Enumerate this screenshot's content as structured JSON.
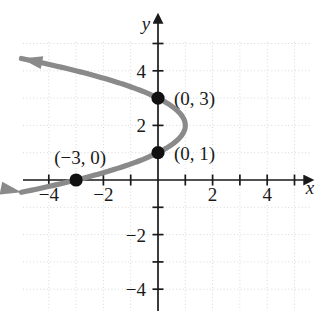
{
  "figure": {
    "background_color": "#ffffff",
    "grid_color": "#d8d8d8",
    "axis_color": "#1a1a1a",
    "curve_color": "#8a8a8a",
    "point_color": "#111111",
    "axis_names": {
      "x": "x",
      "y": "y"
    }
  },
  "chart_data": {
    "type": "line",
    "title": "",
    "xlabel": "x",
    "ylabel": "y",
    "xlim": [
      -5,
      5.5
    ],
    "ylim": [
      -5,
      5
    ],
    "grid": true,
    "grid_step": 1,
    "legend": "none",
    "x_ticks": [
      -4,
      -2,
      2,
      4
    ],
    "x_tick_labels": [
      "−4",
      "−2",
      "2",
      "4"
    ],
    "y_ticks": [
      4,
      2,
      -2,
      -4
    ],
    "y_tick_labels": [
      "4",
      "2",
      "−2",
      "−4"
    ],
    "minor_tick_values_x": [
      -5,
      -4,
      -3,
      -2,
      -1,
      1,
      2,
      3,
      4,
      5
    ],
    "minor_tick_values_y": [
      -5,
      -4,
      -3,
      -2,
      -1,
      1,
      2,
      3,
      4,
      5
    ],
    "curve_description": "leftward-opening parabola with vertex at (1, 2)",
    "curve_equation": "x = -(y - 2)^2 + 1",
    "curve_points": [
      {
        "x": -5.0,
        "y": 4.45
      },
      {
        "x": -4.0,
        "y": 4.24
      },
      {
        "x": -3.0,
        "y": 4.0
      },
      {
        "x": -2.0,
        "y": 3.73
      },
      {
        "x": -1.0,
        "y": 3.41
      },
      {
        "x": 0.0,
        "y": 3.0
      },
      {
        "x": 0.5,
        "y": 2.71
      },
      {
        "x": 0.84,
        "y": 2.4
      },
      {
        "x": 1.0,
        "y": 2.0
      },
      {
        "x": 0.84,
        "y": 1.6
      },
      {
        "x": 0.5,
        "y": 1.29
      },
      {
        "x": 0.0,
        "y": 1.0
      },
      {
        "x": -1.0,
        "y": 0.59
      },
      {
        "x": -2.0,
        "y": 0.27
      },
      {
        "x": -3.0,
        "y": 0.0
      },
      {
        "x": -4.0,
        "y": -0.24
      },
      {
        "x": -5.0,
        "y": -0.45
      }
    ],
    "arrowheads": [
      {
        "at": [
          -5.0,
          4.45
        ],
        "direction": "up-left"
      },
      {
        "at": [
          -5.0,
          -0.45
        ],
        "direction": "down-left"
      }
    ],
    "marked_points": [
      {
        "x": 0,
        "y": 3,
        "label": "(0, 3)",
        "label_position": "right"
      },
      {
        "x": 0,
        "y": 1,
        "label": "(0, 1)",
        "label_position": "right"
      },
      {
        "x": -3,
        "y": 0,
        "label": "(−3, 0)",
        "label_position": "above-left"
      }
    ]
  }
}
